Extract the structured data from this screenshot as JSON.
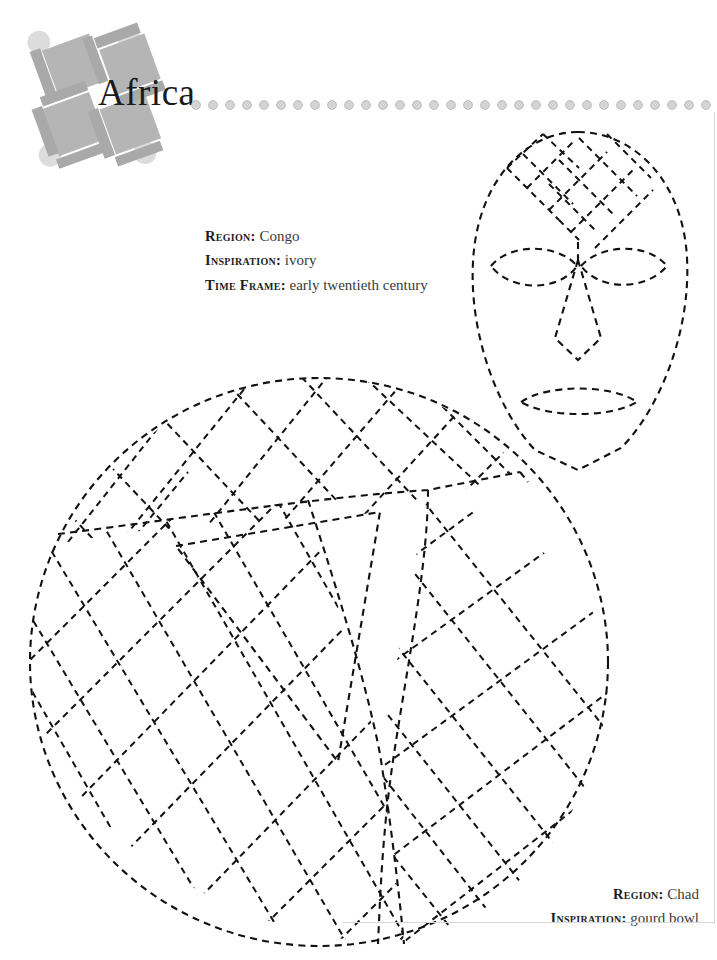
{
  "page": {
    "title": "Africa",
    "background_color": "#ffffff",
    "frame_color": "#d8d8d8"
  },
  "logo": {
    "name": "africa-mosaic-logo",
    "square_color": "#b5b5b5",
    "bar_color": "#a9a9a9",
    "circle_color": "#dcdcdc",
    "rotation_degrees": -20
  },
  "dot_rule": {
    "name": "dotted-rule",
    "dot_color": "#d4d4d4",
    "dot_ring_color": "#bcbcbc",
    "count": 31,
    "spacing_px": 17
  },
  "specs": [
    {
      "id": "congo",
      "align": "left",
      "rows": [
        {
          "label": "Region:",
          "value": "Congo"
        },
        {
          "label": "Inspiration:",
          "value": "ivory"
        },
        {
          "label": "Time Frame:",
          "value": "early twentieth century"
        }
      ]
    },
    {
      "id": "chad",
      "align": "right",
      "rows": [
        {
          "label": "Region:",
          "value": "Chad"
        },
        {
          "label": "Inspiration:",
          "value": "gourd bowl"
        }
      ]
    }
  ],
  "artwork": [
    {
      "name": "mask-pattern",
      "description": "dashed outline mask with diamond lattice forehead, two almond eyes, pointed nose and oval mouth",
      "stroke_color": "#111111",
      "style": "dashed"
    },
    {
      "name": "gourd-bowl-pattern",
      "description": "dashed circle divided into three lobed panels filled with diagonal lattice around a central triangle",
      "stroke_color": "#111111",
      "style": "dashed"
    }
  ]
}
